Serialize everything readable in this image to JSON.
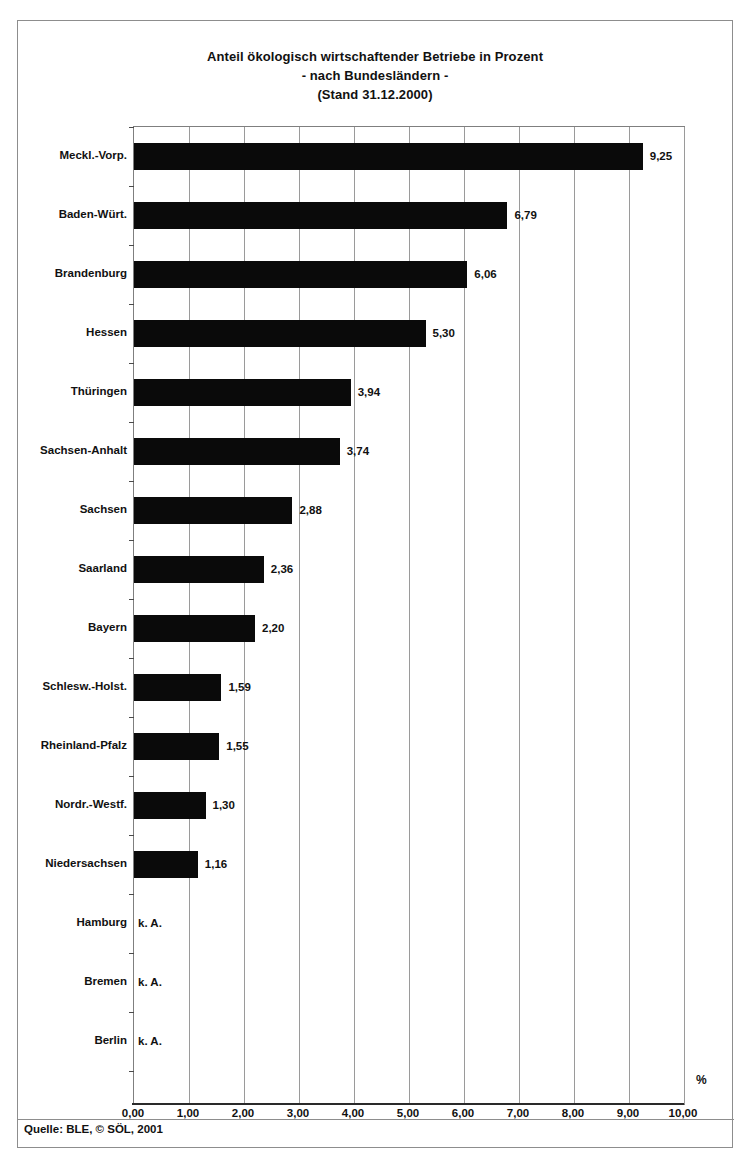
{
  "title": {
    "line1": "Anteil ökologisch wirtschaftender Betriebe in Prozent",
    "line2": "- nach Bundesländern -",
    "line3": "(Stand 31.12.2000)"
  },
  "footer": {
    "source": "Quelle: BLE, © SÖL, 2001"
  },
  "axis": {
    "unit_label": "%",
    "na_text": "k. A."
  },
  "colors": {
    "bar": "#0a0a0a",
    "gridline": "#9a9a9a",
    "frame": "#8d8d8d",
    "text": "#111111",
    "plot_background": "#ffffff"
  },
  "chart_data": {
    "type": "bar",
    "orientation": "horizontal",
    "title": "Anteil ökologisch wirtschaftender Betriebe in Prozent - nach Bundesländern - (Stand 31.12.2000)",
    "xlabel": "%",
    "ylabel": "",
    "xlim": [
      0,
      10
    ],
    "xticks": [
      "0,00",
      "1,00",
      "2,00",
      "3,00",
      "4,00",
      "5,00",
      "6,00",
      "7,00",
      "8,00",
      "9,00",
      "10,00"
    ],
    "xtick_values": [
      0,
      1,
      2,
      3,
      4,
      5,
      6,
      7,
      8,
      9,
      10
    ],
    "grid": "vertical",
    "legend": "none",
    "categories": [
      "Meckl.-Vorp.",
      "Baden-Würt.",
      "Brandenburg",
      "Hessen",
      "Thüringen",
      "Sachsen-Anhalt",
      "Sachsen",
      "Saarland",
      "Bayern",
      "Schlesw.-Holst.",
      "Rheinland-Pfalz",
      "Nordr.-Westf.",
      "Niedersachsen",
      "Hamburg",
      "Bremen",
      "Berlin"
    ],
    "values": [
      9.25,
      6.79,
      6.06,
      5.3,
      3.94,
      3.74,
      2.88,
      2.36,
      2.2,
      1.59,
      1.55,
      1.3,
      1.16,
      null,
      null,
      null
    ],
    "value_labels": [
      "9,25",
      "6,79",
      "6,06",
      "5,30",
      "3,94",
      "3,74",
      "2,88",
      "2,36",
      "2,20",
      "1,59",
      "1,55",
      "1,30",
      "1,16",
      "k. A.",
      "k. A.",
      "k. A."
    ]
  }
}
